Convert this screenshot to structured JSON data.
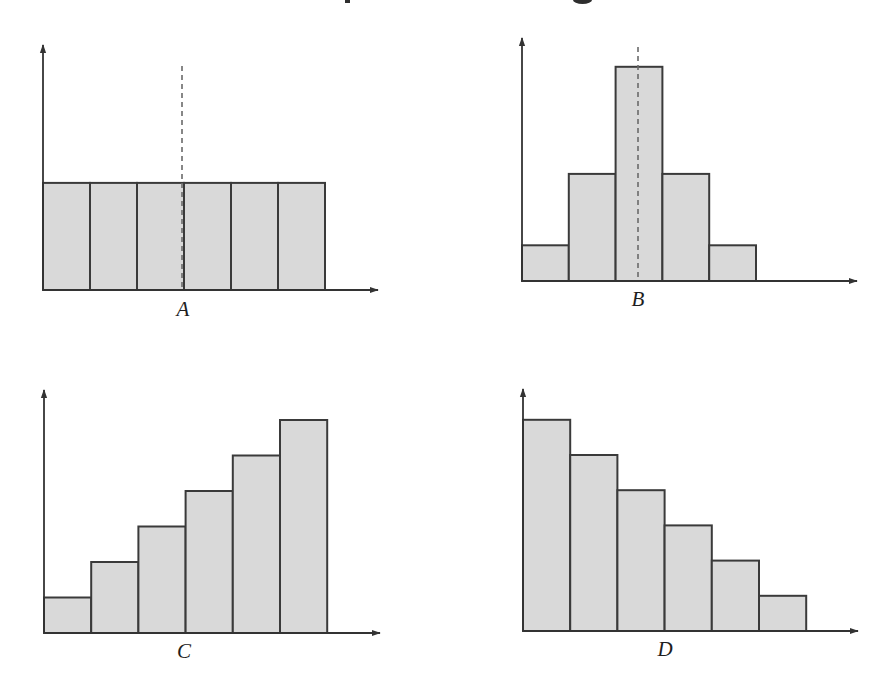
{
  "title_fragments": [
    {
      "x": 345,
      "y": 0,
      "w": 5,
      "h": 3,
      "shape": "stroke"
    },
    {
      "x": 573,
      "y": 0,
      "w": 19,
      "h": 4,
      "shape": "bowl"
    }
  ],
  "style": {
    "bar_fill": "#d9d9d9",
    "stroke": "#3a3a3a",
    "dash": "#6a6a6a"
  },
  "chart_data": [
    {
      "type": "bar",
      "title": "",
      "label": "A",
      "xlabel": "A",
      "ylabel": "",
      "categories": [
        "1",
        "2",
        "3",
        "4",
        "5",
        "6"
      ],
      "values": [
        3,
        3,
        3,
        3,
        3,
        3
      ],
      "ylim": [
        0,
        6
      ],
      "grid": false,
      "dashed_center_line": true,
      "description": "Uniform distribution — six equal-height bars",
      "layout": {
        "ox": 43,
        "oy": 290,
        "bar_w": 47,
        "unit": 35.7,
        "y_tip": 45,
        "x_tip": 378,
        "dash_x": 182,
        "dash_top": 66,
        "label_x": 183,
        "label_y": 316
      }
    },
    {
      "type": "bar",
      "title": "",
      "label": "B",
      "xlabel": "B",
      "ylabel": "",
      "categories": [
        "1",
        "2",
        "3",
        "4",
        "5"
      ],
      "values": [
        1,
        3,
        6,
        3,
        1
      ],
      "ylim": [
        0,
        6.5
      ],
      "grid": false,
      "dashed_center_line": true,
      "description": "Symmetric (bell-shaped) distribution",
      "layout": {
        "ox": 522,
        "oy": 281,
        "bar_w": 46.8,
        "unit": 35.7,
        "y_tip": 38,
        "x_tip": 857,
        "dash_x": 638,
        "dash_top": 47,
        "label_x": 638,
        "label_y": 306
      }
    },
    {
      "type": "bar",
      "title": "",
      "label": "C",
      "xlabel": "C",
      "ylabel": "",
      "categories": [
        "1",
        "2",
        "3",
        "4",
        "5",
        "6"
      ],
      "values": [
        1,
        2,
        3,
        4,
        5,
        6
      ],
      "ylim": [
        0,
        6.5
      ],
      "grid": false,
      "dashed_center_line": false,
      "description": "Left-skewed distribution — bars increase left to right",
      "layout": {
        "ox": 44,
        "oy": 633,
        "bar_w": 47.2,
        "unit": 35.5,
        "y_tip": 390,
        "x_tip": 380,
        "label_x": 184,
        "label_y": 658
      }
    },
    {
      "type": "bar",
      "title": "",
      "label": "D",
      "xlabel": "D",
      "ylabel": "",
      "categories": [
        "1",
        "2",
        "3",
        "4",
        "5",
        "6"
      ],
      "values": [
        6,
        5,
        4,
        3,
        2,
        1
      ],
      "ylim": [
        0,
        6.5
      ],
      "grid": false,
      "dashed_center_line": false,
      "description": "Right-skewed distribution — bars decrease left to right",
      "layout": {
        "ox": 523,
        "oy": 631,
        "bar_w": 47.2,
        "unit": 35.2,
        "y_tip": 389,
        "x_tip": 858,
        "label_x": 665,
        "label_y": 656
      }
    }
  ]
}
